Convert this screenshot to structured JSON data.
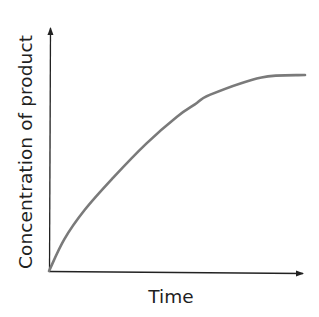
{
  "chart_data": {
    "type": "line",
    "title": "",
    "xlabel": "Time",
    "ylabel": "Concentration of product",
    "x_ticks": [],
    "y_ticks": [],
    "grid": false,
    "legend": null,
    "axes_with_arrows": true,
    "xlim": [
      0,
      1
    ],
    "ylim": [
      0,
      1
    ],
    "series": [
      {
        "name": "product concentration",
        "color": "#7a7a7a",
        "x": [
          0,
          0.06,
          0.14,
          0.25,
          0.38,
          0.5,
          0.57,
          0.63,
          0.83,
          1.0
        ],
        "y": [
          0,
          0.13,
          0.25,
          0.38,
          0.52,
          0.63,
          0.68,
          0.72,
          0.79,
          0.8
        ]
      }
    ]
  },
  "colors": {
    "axis": "#222222",
    "curve": "#7a7a7a",
    "text": "#1f1f1f"
  }
}
